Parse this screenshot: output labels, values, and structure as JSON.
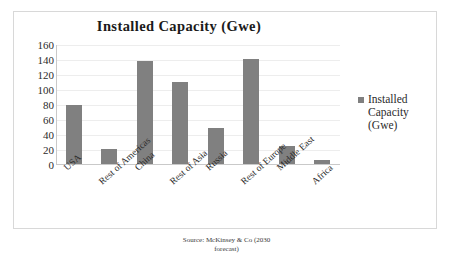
{
  "chart_data": {
    "type": "bar",
    "title": "Installed Capacity (Gwe)",
    "xlabel": "",
    "ylabel": "",
    "categories": [
      "USA",
      "Rest of Americas",
      "China",
      "Rest of Asia",
      "Russia",
      "Rest of Europe",
      "Middle East",
      "Africa"
    ],
    "values": [
      80,
      21,
      139,
      111,
      49,
      141,
      25,
      7
    ],
    "series": [
      {
        "name": "Installed Capacity (Gwe)",
        "values": [
          80,
          21,
          139,
          111,
          49,
          141,
          25,
          7
        ]
      }
    ],
    "ylim": [
      0,
      160
    ],
    "yticks": [
      0,
      20,
      40,
      60,
      80,
      100,
      120,
      140,
      160
    ],
    "ytick_labels": [
      "0",
      "20",
      "40",
      "60",
      "80",
      "100",
      "120",
      "140",
      "160"
    ],
    "grid": true,
    "legend_position": "right",
    "legend_entries": [
      "Installed Capacity (Gwe)"
    ],
    "bar_color": "#808080"
  },
  "legend": {
    "lines": [
      "Installed",
      "Capacity",
      "(Gwe)"
    ]
  },
  "source": {
    "line1": "Source:  McKinsey & Co (2030",
    "line2": "forecast)"
  },
  "colors": {
    "bar": "#808080",
    "gridline": "#ededed",
    "axis": "#c9c9c9",
    "frame": "#d8d8d8",
    "text": "#2b2b2b"
  }
}
